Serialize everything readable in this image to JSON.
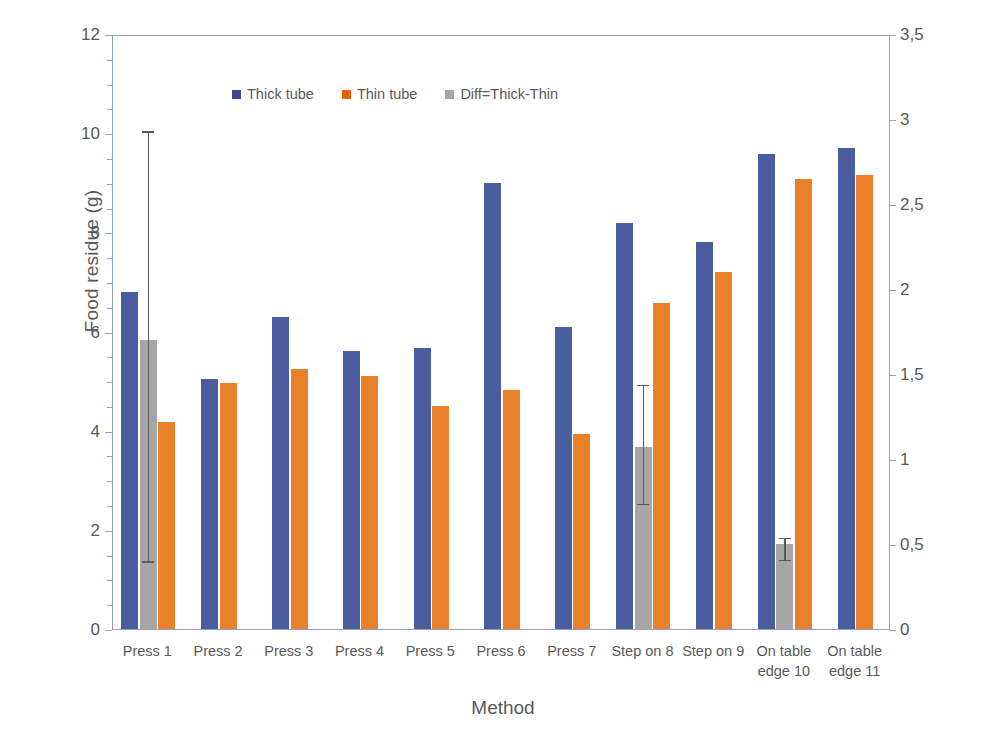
{
  "chart_data": {
    "type": "bar",
    "title": "",
    "xlabel": "Method",
    "ylabel": "Food residue (g)",
    "y2label": "Difference Residue Thick-Thin (g)",
    "categories": [
      "Press 1",
      "Press 2",
      "Press 3",
      "Press 4",
      "Press 5",
      "Press 6",
      "Press 7",
      "Step on 8",
      "Step on 9",
      "On table edge 10",
      "On table edge 11"
    ],
    "category_lines": [
      [
        "Press 1"
      ],
      [
        "Press 2"
      ],
      [
        "Press 3"
      ],
      [
        "Press 4"
      ],
      [
        "Press 5"
      ],
      [
        "Press 6"
      ],
      [
        "Press 7"
      ],
      [
        "Step on 8"
      ],
      [
        "Step on 9"
      ],
      [
        "On table",
        "edge 10"
      ],
      [
        "On table",
        "edge 11"
      ]
    ],
    "series": [
      {
        "name": "Thick tube",
        "axis": "left",
        "color": "#4a5d9e",
        "values": [
          6.8,
          5.05,
          6.3,
          5.6,
          5.67,
          9.0,
          6.1,
          8.18,
          7.8,
          9.58,
          9.7
        ]
      },
      {
        "name": "Thin tube",
        "axis": "left",
        "color": "#e8812a",
        "values": [
          4.18,
          4.97,
          5.25,
          5.1,
          4.5,
          4.82,
          3.93,
          6.58,
          7.2,
          9.08,
          9.15
        ]
      },
      {
        "name": "Diff=Thick-Thin",
        "axis": "right",
        "color": "#a6a6a6",
        "values": [
          1.7,
          null,
          null,
          null,
          null,
          null,
          null,
          1.07,
          null,
          0.5,
          null
        ],
        "error_low": [
          0.41,
          null,
          null,
          null,
          null,
          null,
          null,
          0.75,
          null,
          0.42,
          null
        ],
        "error_high": [
          2.94,
          null,
          null,
          null,
          null,
          null,
          null,
          1.45,
          null,
          0.55,
          null
        ]
      }
    ],
    "ylim": [
      0,
      12
    ],
    "yticks": [
      0,
      2,
      4,
      6,
      8,
      10,
      12
    ],
    "ytick_labels": [
      "0",
      "2",
      "4",
      "6",
      "8",
      "10",
      "12"
    ],
    "y2lim": [
      0,
      3.5
    ],
    "y2ticks": [
      0,
      0.5,
      1,
      1.5,
      2,
      2.5,
      3,
      3.5
    ],
    "y2tick_labels": [
      "0",
      "0,5",
      "1",
      "1,5",
      "2",
      "2,5",
      "3",
      "3,5"
    ],
    "grid": false,
    "legend_position": "top-center",
    "legend_entries": [
      "Thick tube",
      "Thin tube",
      "Diff=Thick-Thin"
    ],
    "colors": {
      "thick_tube": "#4a5d9e",
      "thin_tube": "#e8812a",
      "diff": "#a6a6a6",
      "axis": "#8fa0c8",
      "text": "#595959"
    }
  }
}
